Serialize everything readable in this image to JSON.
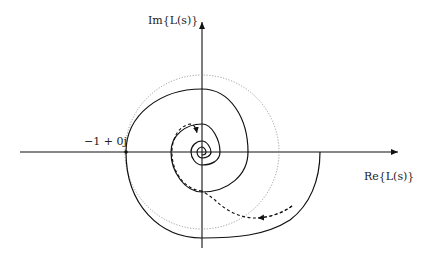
{
  "diagram": {
    "type": "nyquist-plot",
    "axes": {
      "x_label": "Re{L(s)}",
      "y_label": "Im{L(s)}"
    },
    "critical_point": {
      "label": "−1 + 0j",
      "value": "-1+0j"
    },
    "curves": [
      {
        "name": "nyquist-spiral",
        "style": "solid",
        "description": "L(jω) spiraling inward to origin"
      },
      {
        "name": "unit-circle",
        "style": "dotted",
        "description": "unit circle |L|=1"
      },
      {
        "name": "perturbed-path",
        "style": "dashed-arrow",
        "description": "dashed arrow path illustrating encirclement change"
      }
    ],
    "colors": {
      "axis": "#111111",
      "curve": "#111111",
      "unit_circle": "#888888"
    }
  }
}
